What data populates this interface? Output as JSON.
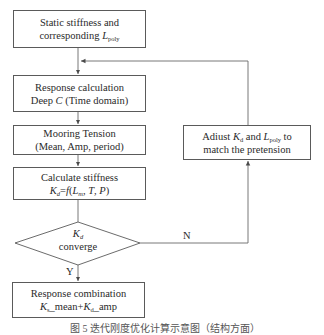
{
  "diagram": {
    "type": "flowchart",
    "nodes": [
      {
        "id": "static",
        "shape": "rect",
        "line1": "Static stiffness and",
        "line2_prefix": "corresponding ",
        "line2_var": "L",
        "line2_sub": "poly"
      },
      {
        "id": "response",
        "shape": "rect",
        "line1": "Response calculation",
        "line2_prefix": "Deep ",
        "line2_var": "C",
        "line2_suffix": " (Time domain)"
      },
      {
        "id": "tension",
        "shape": "rect",
        "line1": "Mooring Tension",
        "line2": "(Mean, Amp, period)"
      },
      {
        "id": "stiffness",
        "shape": "rect",
        "line1": "Calculate stiffness",
        "formula": {
          "lhs_var": "K",
          "lhs_sub": "d",
          "eq": "=",
          "func": "f",
          "open": "(",
          "a_var": "L",
          "a_sub": "m",
          "sep1": ", ",
          "b": "T",
          "sep2": ", ",
          "c": "P",
          "close": ")"
        }
      },
      {
        "id": "converge",
        "shape": "diamond",
        "var": "K",
        "sub": "d",
        "text": "converge"
      },
      {
        "id": "combination",
        "shape": "rect",
        "line1": "Response combination",
        "formula": {
          "a_var": "K",
          "a_sub": "s",
          "a_text": "_mean+",
          "b_var": "K",
          "b_sub": "d",
          "b_text": "_amp"
        }
      },
      {
        "id": "adjust",
        "shape": "rect",
        "p1": "Adiust ",
        "v1": "K",
        "s1": "d",
        "p2": " and ",
        "v2": "L",
        "s2": "poly",
        "p3": " to",
        "line2": "match the pretension"
      }
    ],
    "edges": [
      {
        "from": "static",
        "to": "response"
      },
      {
        "from": "response",
        "to": "tension"
      },
      {
        "from": "tension",
        "to": "stiffness"
      },
      {
        "from": "stiffness",
        "to": "converge"
      },
      {
        "from": "converge",
        "to": "combination",
        "label": "Y"
      },
      {
        "from": "converge",
        "to": "adjust",
        "label": "N"
      },
      {
        "from": "adjust",
        "to": "response"
      }
    ],
    "labels": {
      "yes": "Y",
      "no": "N"
    },
    "caption": "图 5  迭代刚度优化计算示意图（结构方面）"
  }
}
